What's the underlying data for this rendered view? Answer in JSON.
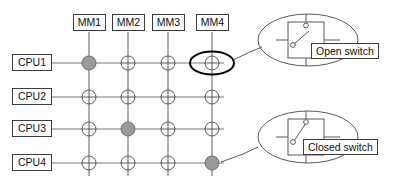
{
  "diagram": {
    "colors": {
      "line": "#7a7a7a",
      "line_dark": "#4a4a4a",
      "outline": "#3c3c3c",
      "closed_fill": "#9a9a9a",
      "open_fill": "#ffffff",
      "highlight": "#000000",
      "text": "#101010",
      "background": "#ffffff"
    },
    "columns": [
      {
        "id": "mm1",
        "label": "MM1",
        "x": 89
      },
      {
        "id": "mm2",
        "label": "MM2",
        "x": 128
      },
      {
        "id": "mm3",
        "label": "MM3",
        "x": 168
      },
      {
        "id": "mm4",
        "label": "MM4",
        "x": 212
      }
    ],
    "rows": [
      {
        "id": "cpu1",
        "label": "CPU1",
        "y": 63
      },
      {
        "id": "cpu2",
        "label": "CPU2",
        "y": 97
      },
      {
        "id": "cpu3",
        "label": "CPU3",
        "y": 129
      },
      {
        "id": "cpu4",
        "label": "CPU4",
        "y": 163
      }
    ],
    "crosspoints": [
      {
        "row": "cpu1",
        "col": "mm1",
        "state": "closed",
        "highlighted": false
      },
      {
        "row": "cpu1",
        "col": "mm2",
        "state": "open",
        "highlighted": false
      },
      {
        "row": "cpu1",
        "col": "mm3",
        "state": "open",
        "highlighted": false
      },
      {
        "row": "cpu1",
        "col": "mm4",
        "state": "open",
        "highlighted": true
      },
      {
        "row": "cpu2",
        "col": "mm1",
        "state": "open",
        "highlighted": false
      },
      {
        "row": "cpu2",
        "col": "mm2",
        "state": "open",
        "highlighted": false
      },
      {
        "row": "cpu2",
        "col": "mm3",
        "state": "open",
        "highlighted": false
      },
      {
        "row": "cpu2",
        "col": "mm4",
        "state": "open",
        "highlighted": false
      },
      {
        "row": "cpu3",
        "col": "mm1",
        "state": "open",
        "highlighted": false
      },
      {
        "row": "cpu3",
        "col": "mm2",
        "state": "closed",
        "highlighted": false
      },
      {
        "row": "cpu3",
        "col": "mm3",
        "state": "open",
        "highlighted": false
      },
      {
        "row": "cpu3",
        "col": "mm4",
        "state": "open",
        "highlighted": false
      },
      {
        "row": "cpu4",
        "col": "mm1",
        "state": "open",
        "highlighted": false
      },
      {
        "row": "cpu4",
        "col": "mm2",
        "state": "open",
        "highlighted": false
      },
      {
        "row": "cpu4",
        "col": "mm3",
        "state": "open",
        "highlighted": false
      },
      {
        "row": "cpu4",
        "col": "mm4",
        "state": "closed",
        "highlighted": false
      }
    ],
    "callouts": [
      {
        "id": "open-switch-callout",
        "label": "Open switch",
        "state": "open",
        "source_row": "cpu1",
        "source_col": "mm4"
      },
      {
        "id": "closed-switch-callout",
        "label": "Closed switch",
        "state": "closed",
        "source_row": "cpu4",
        "source_col": "mm4"
      }
    ]
  }
}
